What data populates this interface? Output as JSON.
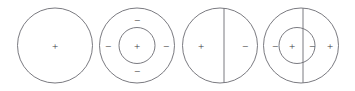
{
  "figure": {
    "background_color": "#ffffff",
    "stroke_color": "#6b6b72",
    "text_color": "#3a3a3a",
    "stroke_width": 0.9,
    "panel_count": 4,
    "symbols": {
      "plus": "+",
      "minus": "−"
    },
    "panels": [
      {
        "id": "panel-1",
        "name": "uniform-positive-sphere",
        "outer_circle": {
          "cx": 55,
          "cy": 45.5,
          "r": 37.5
        },
        "inner_circle": null,
        "divider_line": null,
        "charges": [
          {
            "position": "center",
            "sign": "+",
            "x": 55,
            "y": 45.5
          }
        ]
      },
      {
        "id": "panel-2",
        "name": "positive-core-with-four-outer-negatives",
        "outer_circle": {
          "cx": 137,
          "cy": 45.5,
          "r": 37.5
        },
        "inner_circle": {
          "cx": 137,
          "cy": 45.5,
          "r": 18
        },
        "divider_line": null,
        "charges": [
          {
            "position": "center",
            "sign": "+",
            "x": 137,
            "y": 45.5
          },
          {
            "position": "top",
            "sign": "−",
            "x": 137,
            "y": 20
          },
          {
            "position": "left",
            "sign": "−",
            "x": 108,
            "y": 45.5
          },
          {
            "position": "right",
            "sign": "−",
            "x": 166,
            "y": 45.5
          },
          {
            "position": "bottom",
            "sign": "−",
            "x": 137,
            "y": 71
          }
        ]
      },
      {
        "id": "panel-3",
        "name": "split-sphere-positive-negative",
        "outer_circle": {
          "cx": 220,
          "cy": 45.5,
          "r": 37.5
        },
        "inner_circle": null,
        "divider_line": {
          "x": 224,
          "y1": 8,
          "y2": 83
        },
        "charges": [
          {
            "position": "left",
            "sign": "+",
            "x": 201,
            "y": 45.5
          },
          {
            "position": "right",
            "sign": "−",
            "x": 245,
            "y": 45.5
          }
        ]
      },
      {
        "id": "panel-4",
        "name": "split-core-alternating-charges",
        "outer_circle": {
          "cx": 301,
          "cy": 45.5,
          "r": 37.5
        },
        "inner_circle": {
          "cx": 297,
          "cy": 45.5,
          "r": 18
        },
        "divider_line": {
          "x": 303,
          "y1": 8,
          "y2": 83
        },
        "charges": [
          {
            "position": "outer-left",
            "sign": "−",
            "x": 275,
            "y": 45.5
          },
          {
            "position": "inner-left",
            "sign": "+",
            "x": 292,
            "y": 45.5
          },
          {
            "position": "inner-right",
            "sign": "−",
            "x": 311,
            "y": 45.5
          },
          {
            "position": "outer-right",
            "sign": "+",
            "x": 330,
            "y": 45.5
          }
        ]
      }
    ]
  }
}
